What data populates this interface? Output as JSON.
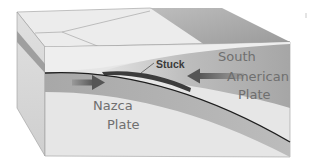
{
  "diagram": {
    "type": "subduction-zone-block-diagram",
    "labels": {
      "stuck": "Stuck",
      "south_american_line1": "South",
      "south_american_line2": "American",
      "south_american_line3": "Plate",
      "nazca_line1": "Nazca",
      "nazca_line2": "Plate"
    },
    "arrows": [
      {
        "name": "nazca-plate-motion-arrow",
        "direction": "right"
      },
      {
        "name": "south-american-plate-motion-arrow",
        "direction": "left"
      }
    ],
    "colors": {
      "background": "#ffffff",
      "top_face_light": "#ececec",
      "top_face_dark": "#a9a9a9",
      "side_face": "#d8d8d8",
      "front_face_light": "#e6e6e6",
      "oceanic_plate_band": "#b4b4b4",
      "continental_wedge": "#b8b8b8",
      "fault_line": "#1e1e1e",
      "stuck_zone": "#3c3c3c",
      "arrow": "#6a6a6a",
      "label_text": "#6f6f6f"
    }
  }
}
